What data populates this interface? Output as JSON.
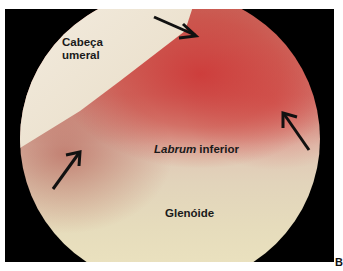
{
  "figure": {
    "panel_letter": "B",
    "labels": {
      "humeral_head": [
        "Cabeça",
        "umeral"
      ],
      "labrum_italic": "Labrum",
      "labrum_rest": " inferior",
      "glenoid": "Glenóide"
    },
    "arrows": [
      {
        "name": "arrow-top",
        "from": [
          154,
          17
        ],
        "to": [
          196,
          36
        ]
      },
      {
        "name": "arrow-right",
        "from": [
          309,
          150
        ],
        "to": [
          283,
          113
        ]
      },
      {
        "name": "arrow-left",
        "from": [
          53,
          189
        ],
        "to": [
          80,
          152
        ]
      }
    ],
    "colors": {
      "frame": "#000000",
      "humeral_head": "#efe6d4",
      "synovitis_red": "#cd3232",
      "glenoid": "#e6dcbc"
    }
  }
}
